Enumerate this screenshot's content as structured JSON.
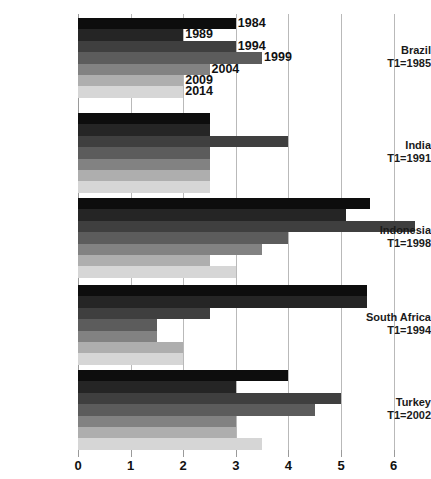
{
  "chart_data": {
    "type": "bar",
    "orientation": "horizontal",
    "title": "",
    "subtitle": "",
    "xlabel": "",
    "ylabel": "",
    "xlim": [
      0,
      6.6
    ],
    "xticks": [
      0,
      1,
      2,
      3,
      4,
      5,
      6
    ],
    "xtick_labels": [
      "0",
      "1",
      "2",
      "3",
      "4",
      "5",
      "6"
    ],
    "grid": "vertical",
    "legend_position": "in-plot-annotations",
    "series": [
      {
        "name": "1984",
        "shade": "#0d0d0d",
        "values": [
          3.0,
          2.5,
          5.55,
          5.5,
          4.0
        ]
      },
      {
        "name": "1989",
        "shade": "#252525",
        "values": [
          2.0,
          2.5,
          5.1,
          5.5,
          3.0
        ]
      },
      {
        "name": "1994",
        "shade": "#3f3f3f",
        "values": [
          3.0,
          4.0,
          6.4,
          2.5,
          5.0
        ]
      },
      {
        "name": "1999",
        "shade": "#5c5c5c",
        "values": [
          3.5,
          2.5,
          4.0,
          1.5,
          4.5
        ]
      },
      {
        "name": "2004",
        "shade": "#828282",
        "values": [
          2.5,
          2.5,
          3.5,
          1.5,
          3.0
        ]
      },
      {
        "name": "2009",
        "shade": "#aeaeae",
        "values": [
          2.0,
          2.5,
          2.5,
          2.0,
          3.0
        ]
      },
      {
        "name": "2014",
        "shade": "#d6d6d6",
        "values": [
          2.0,
          2.5,
          3.0,
          2.0,
          3.5
        ]
      }
    ],
    "categories": [
      {
        "name": "Brazil",
        "baseline_label": "T1=1985"
      },
      {
        "name": "India",
        "baseline_label": "T1=1991"
      },
      {
        "name": "Indonesia",
        "baseline_label": "T1=1998"
      },
      {
        "name": "South Africa",
        "baseline_label": "T1=1994"
      },
      {
        "name": "Turkey",
        "baseline_label": "T1=2002"
      }
    ],
    "annotations": [
      {
        "text": "1984",
        "series": "1984",
        "category": "Brazil"
      },
      {
        "text": "1989",
        "series": "1989",
        "category": "Brazil"
      },
      {
        "text": "1994",
        "series": "1994",
        "category": "Brazil"
      },
      {
        "text": "1999",
        "series": "1999",
        "category": "Brazil"
      },
      {
        "text": "2004",
        "series": "2004",
        "category": "Brazil"
      },
      {
        "text": "2009",
        "series": "2009",
        "category": "Brazil"
      },
      {
        "text": "2014",
        "series": "2014",
        "category": "Brazil"
      }
    ],
    "colors": {
      "gridline": "#b9b9b9",
      "axis": "#9a9a9a",
      "text": "#111111",
      "background": "#ffffff"
    }
  },
  "layout": {
    "plot_left": 78,
    "plot_top": 14,
    "unit_px": 52.6,
    "group_tops": [
      18,
      113,
      198,
      285,
      370
    ],
    "group_height": 80,
    "bar_height": 11.4
  }
}
